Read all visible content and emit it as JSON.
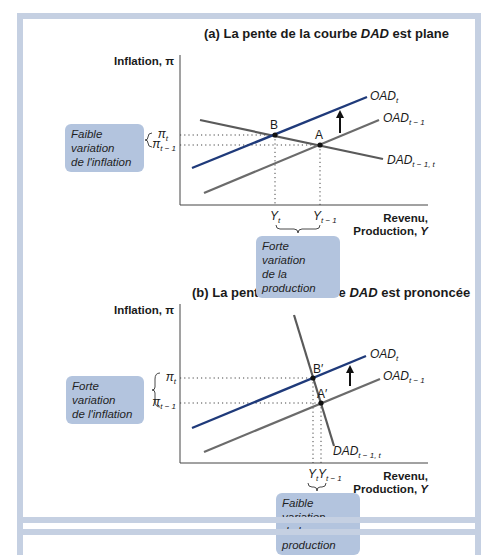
{
  "panel_a": {
    "title_prefix": "(a) La pente de la courbe ",
    "title_italic": "DAD",
    "title_suffix": " est plane",
    "y_axis_label": "Inflation, π",
    "x_axis_label_1": "Revenu,",
    "x_axis_label_2": "Production, Y",
    "curves": {
      "oad_t": "OAD",
      "oad_t_sub": "t",
      "oad_t1": "OAD",
      "oad_t1_sub": "t − 1",
      "dad": "DAD",
      "dad_sub": "t − 1, t"
    },
    "points": {
      "b": "B",
      "a": "A"
    },
    "y_ticks": {
      "pi_t": "π",
      "pi_t_sub": "t",
      "pi_t1": "π",
      "pi_t1_sub": "t − 1"
    },
    "x_ticks": {
      "y_t": "Y",
      "y_t_sub": "t",
      "y_t1": "Y",
      "y_t1_sub": "t − 1"
    },
    "note_inflation_1": "Faible variation",
    "note_inflation_2": "de l'inflation",
    "note_production_1": "Forte variation",
    "note_production_2": "de la production"
  },
  "panel_b": {
    "title_prefix": "(b) La pente de la courbe ",
    "title_italic": "DAD",
    "title_suffix": " est prononcée",
    "y_axis_label": "Inflation, π",
    "x_axis_label_1": "Revenu,",
    "x_axis_label_2": "Production, Y",
    "curves": {
      "oad_t": "OAD",
      "oad_t_sub": "t",
      "oad_t1": "OAD",
      "oad_t1_sub": "t − 1",
      "dad": "DAD",
      "dad_sub": "t − 1, t"
    },
    "points": {
      "b": "B′",
      "a": "A′"
    },
    "y_ticks": {
      "pi_t": "π",
      "pi_t_sub": "t",
      "pi_t1": "π",
      "pi_t1_sub": "t − 1"
    },
    "x_ticks": {
      "y_t": "Y",
      "y_t_sub": "t",
      "y_t1": "Y",
      "y_t1_sub": "t − 1"
    },
    "note_inflation_1": "Forte variation",
    "note_inflation_2": "de l'inflation",
    "note_production_1": "Faible variation",
    "note_production_2": "de la production"
  },
  "colors": {
    "frame": "#c5d0e2",
    "oad_t": "#1f3a7a",
    "oad_t1": "#6b6b6b",
    "dad": "#5a5a5a",
    "note_bg": "#b3c4de"
  }
}
